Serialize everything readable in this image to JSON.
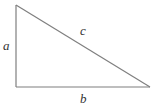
{
  "diagram": {
    "type": "right-triangle",
    "labels": {
      "vertical_leg": "a",
      "horizontal_leg": "b",
      "hypotenuse": "c"
    },
    "colors": {
      "line": "#7f7f7f",
      "text": "#333333",
      "background": "#ffffff"
    }
  }
}
